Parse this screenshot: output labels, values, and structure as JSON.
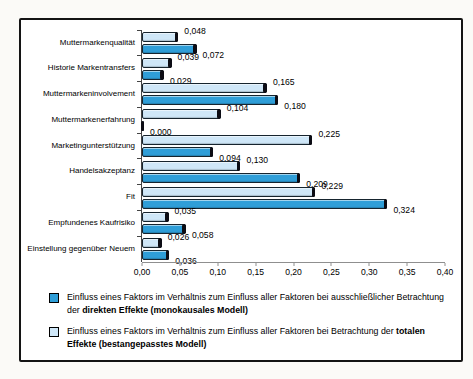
{
  "chart_data": {
    "type": "bar",
    "orientation": "horizontal",
    "title": "",
    "xlabel": "",
    "ylabel": "",
    "grid": false,
    "legend_position": "bottom",
    "xlim": [
      0,
      0.4
    ],
    "x_ticks": [
      "0,00",
      "0,05",
      "0,10",
      "0,15",
      "0,20",
      "0,25",
      "0,30",
      "0,35",
      "0,40"
    ],
    "decimal_separator": ",",
    "value_label_decimals": 3,
    "categories": [
      "Muttermarkenqualität",
      "Historie Markentransfers",
      "Muttermarkeninvolvement",
      "Muttermarkenerfahrung",
      "Marketingunterstützung",
      "Handelsakzeptanz",
      "Fit",
      "Empfundenes Kaufrisiko",
      "Einstellung gegenüber Neuem"
    ],
    "series": [
      {
        "name": "Totale Effekte (bestangepasstes Modell)",
        "color_key": "bar_light",
        "position": "top",
        "values": [
          0.048,
          0.039,
          0.165,
          0.104,
          0.225,
          0.13,
          0.229,
          0.035,
          0.026
        ]
      },
      {
        "name": "Direkte Effekte (monokausales Modell)",
        "color_key": "bar_dark",
        "position": "bottom",
        "values": [
          0.072,
          0.029,
          0.18,
          0.0,
          0.094,
          0.209,
          0.324,
          0.058,
          0.036
        ]
      }
    ]
  },
  "legend": {
    "items": [
      {
        "swatch": "dark",
        "text_normal": "Einfluss eines Faktors im Verhältnis zum Einfluss aller Faktoren bei ausschließlicher Betrachtung der ",
        "text_bold": "direkten Effekte (monokausales Modell)"
      },
      {
        "swatch": "light",
        "text_normal": "Einfluss eines Faktors im Verhältnis zum Einfluss aller Faktoren bei Betrachtung der ",
        "text_bold": "totalen Effekte (bestangepasstes Modell)"
      }
    ]
  },
  "colors": {
    "bar_dark": "#2f9ed8",
    "bar_light": "#cfe7f8",
    "bar_cap": "#0c0c14",
    "axis": "#444444",
    "frame_border": "#141414",
    "background": "#ffffff",
    "text": "#000000"
  }
}
